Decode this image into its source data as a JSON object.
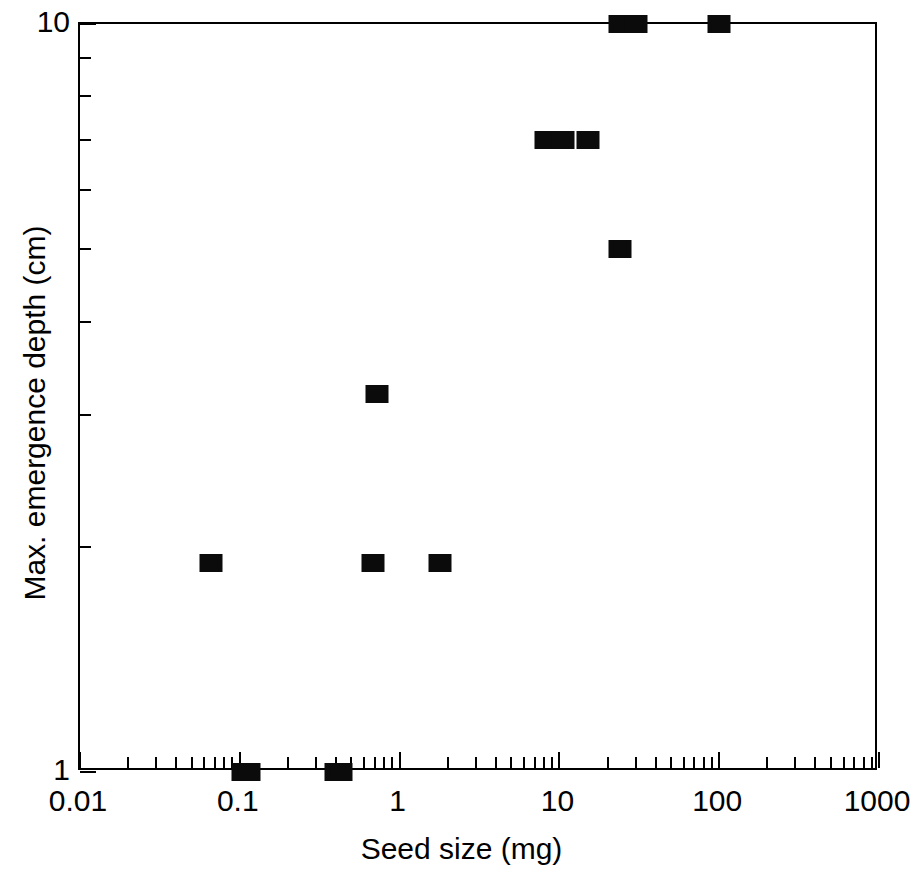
{
  "chart_data": {
    "type": "scatter",
    "title": "",
    "xlabel": "Seed size (mg)",
    "ylabel": "Max. emergence depth (cm)",
    "xscale": "log",
    "yscale": "log",
    "xlim": [
      0.01,
      1000
    ],
    "ylim": [
      1,
      10
    ],
    "grid": false,
    "legend": null,
    "xticks": [
      0.01,
      0.1,
      1,
      10,
      100,
      1000
    ],
    "xtick_labels": [
      "0.01",
      "0.1",
      "1",
      "10",
      "100",
      "1000"
    ],
    "yticks": [
      1,
      10
    ],
    "ytick_labels": [
      "1",
      "10"
    ],
    "y_minor_ticks": [
      2,
      3,
      4,
      5,
      6,
      7,
      8,
      9
    ],
    "marker": "filled-square",
    "marker_color": "#0b0b0b",
    "points": [
      {
        "x": 0.066,
        "y": 1.9
      },
      {
        "x": 0.105,
        "y": 1.0
      },
      {
        "x": 0.115,
        "y": 1.0
      },
      {
        "x": 0.4,
        "y": 1.0
      },
      {
        "x": 0.43,
        "y": 1.0
      },
      {
        "x": 0.68,
        "y": 1.9
      },
      {
        "x": 0.72,
        "y": 3.2
      },
      {
        "x": 1.8,
        "y": 1.9
      },
      {
        "x": 8.2,
        "y": 7.0
      },
      {
        "x": 10.5,
        "y": 7.0
      },
      {
        "x": 15.0,
        "y": 7.0
      },
      {
        "x": 24.0,
        "y": 5.0
      },
      {
        "x": 24.0,
        "y": 10.0
      },
      {
        "x": 30.0,
        "y": 10.0
      },
      {
        "x": 100.0,
        "y": 10.0
      }
    ]
  },
  "axes": {
    "x_title": "Seed size (mg)",
    "y_title": "Max. emergence depth (cm)",
    "x_tick_labels": [
      "0.01",
      "0.1",
      "1",
      "10",
      "100",
      "1000"
    ],
    "y_tick_labels": [
      "10",
      "1"
    ]
  }
}
